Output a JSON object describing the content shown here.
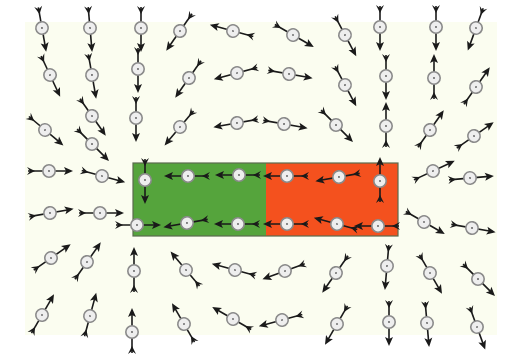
{
  "figure": {
    "colors": {
      "page_background": "#ffffff",
      "panel_background": "#fbfdf0",
      "magnet_south": "#55a43c",
      "magnet_north": "#f4511e",
      "magnet_border": "#5a6b4e",
      "needle": "#1a1a1a",
      "compass_ring": "#8a8a8a",
      "compass_face": "#eeeeee"
    },
    "panel": {
      "x": 25,
      "y": 22,
      "width": 472,
      "height": 313
    },
    "magnet": {
      "x": 133,
      "y": 163,
      "width": 265,
      "height": 73,
      "south_pole": {
        "label": "S",
        "x": 133,
        "width": 133
      },
      "north_pole": {
        "label": "N",
        "x": 266,
        "width": 132
      }
    },
    "compasses": [
      {
        "x": 42,
        "y": 28,
        "angle": 80,
        "partial": true
      },
      {
        "x": 90,
        "y": 28,
        "angle": 85,
        "partial": true
      },
      {
        "x": 141,
        "y": 28,
        "angle": 90,
        "partial": true
      },
      {
        "x": 180,
        "y": 31,
        "angle": 125
      },
      {
        "x": 233,
        "y": 31,
        "angle": 195
      },
      {
        "x": 293,
        "y": 35,
        "angle": 30
      },
      {
        "x": 345,
        "y": 35,
        "angle": 62
      },
      {
        "x": 380,
        "y": 27,
        "angle": 90,
        "partial": true
      },
      {
        "x": 436,
        "y": 27,
        "angle": 90,
        "partial": true
      },
      {
        "x": 476,
        "y": 28,
        "angle": 110,
        "partial": true
      },
      {
        "x": 50,
        "y": 75,
        "angle": 65
      },
      {
        "x": 92,
        "y": 75,
        "angle": 80
      },
      {
        "x": 138,
        "y": 69,
        "angle": 90
      },
      {
        "x": 189,
        "y": 78,
        "angle": 125
      },
      {
        "x": 237,
        "y": 73,
        "angle": 165
      },
      {
        "x": 289,
        "y": 74,
        "angle": 10
      },
      {
        "x": 345,
        "y": 85,
        "angle": 62
      },
      {
        "x": 386,
        "y": 76,
        "angle": 90
      },
      {
        "x": 434,
        "y": 78,
        "angle": -90
      },
      {
        "x": 476,
        "y": 87,
        "angle": -55
      },
      {
        "x": 45,
        "y": 130,
        "angle": 40
      },
      {
        "x": 92,
        "y": 116,
        "angle": 55
      },
      {
        "x": 136,
        "y": 118,
        "angle": 90
      },
      {
        "x": 180,
        "y": 127,
        "angle": 130
      },
      {
        "x": 237,
        "y": 123,
        "angle": 170
      },
      {
        "x": 284,
        "y": 124,
        "angle": 10
      },
      {
        "x": 336,
        "y": 125,
        "angle": 45
      },
      {
        "x": 386,
        "y": 126,
        "angle": -90
      },
      {
        "x": 430,
        "y": 130,
        "angle": -55
      },
      {
        "x": 474,
        "y": 136,
        "angle": -35
      },
      {
        "x": 92,
        "y": 144,
        "angle": 45
      },
      {
        "x": 49,
        "y": 171,
        "angle": 0
      },
      {
        "x": 102,
        "y": 176,
        "angle": 15
      },
      {
        "x": 433,
        "y": 171,
        "angle": -25
      },
      {
        "x": 470,
        "y": 178,
        "angle": -5
      },
      {
        "x": 50,
        "y": 213,
        "angle": -10
      },
      {
        "x": 100,
        "y": 213,
        "angle": 0
      },
      {
        "x": 424,
        "y": 222,
        "angle": 30
      },
      {
        "x": 472,
        "y": 228,
        "angle": 10
      },
      {
        "x": 51,
        "y": 258,
        "angle": -35
      },
      {
        "x": 87,
        "y": 262,
        "angle": -55
      },
      {
        "x": 134,
        "y": 271,
        "angle": -90
      },
      {
        "x": 186,
        "y": 270,
        "angle": -130
      },
      {
        "x": 235,
        "y": 270,
        "angle": -165
      },
      {
        "x": 285,
        "y": 271,
        "angle": 160
      },
      {
        "x": 336,
        "y": 273,
        "angle": 125
      },
      {
        "x": 387,
        "y": 266,
        "angle": 95
      },
      {
        "x": 430,
        "y": 273,
        "angle": 60
      },
      {
        "x": 478,
        "y": 279,
        "angle": 45
      },
      {
        "x": 42,
        "y": 315,
        "angle": -60
      },
      {
        "x": 90,
        "y": 316,
        "angle": -75
      },
      {
        "x": 132,
        "y": 332,
        "angle": -90
      },
      {
        "x": 184,
        "y": 324,
        "angle": -120
      },
      {
        "x": 233,
        "y": 319,
        "angle": -150
      },
      {
        "x": 282,
        "y": 320,
        "angle": 165
      },
      {
        "x": 337,
        "y": 324,
        "angle": 120
      },
      {
        "x": 389,
        "y": 322,
        "angle": 90
      },
      {
        "x": 427,
        "y": 323,
        "angle": 85
      },
      {
        "x": 477,
        "y": 327,
        "angle": 70
      }
    ],
    "inside_magnet_compasses": [
      {
        "x": 145,
        "y": 180,
        "angle": 90
      },
      {
        "x": 188,
        "y": 176,
        "angle": 180
      },
      {
        "x": 239,
        "y": 175,
        "angle": 180
      },
      {
        "x": 287,
        "y": 176,
        "angle": 180
      },
      {
        "x": 339,
        "y": 177,
        "angle": 170
      },
      {
        "x": 380,
        "y": 181,
        "angle": -90
      },
      {
        "x": 137,
        "y": 225,
        "angle": 0
      },
      {
        "x": 187,
        "y": 223,
        "angle": 170
      },
      {
        "x": 238,
        "y": 224,
        "angle": 180
      },
      {
        "x": 287,
        "y": 224,
        "angle": 180
      },
      {
        "x": 337,
        "y": 224,
        "angle": 195
      },
      {
        "x": 378,
        "y": 226,
        "angle": 180
      }
    ]
  }
}
